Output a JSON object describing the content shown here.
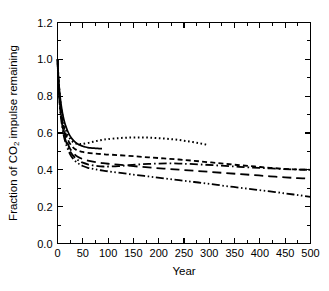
{
  "chart_data": {
    "type": "line",
    "title": "",
    "xlabel": "Year",
    "ylabel": "Fraction of CO2 impulse remaining",
    "ylabel_parts": {
      "pre": "Fraction of CO",
      "sub": "2",
      "post": " impulse remaining"
    },
    "xlim": [
      0,
      500
    ],
    "ylim": [
      0.0,
      1.2
    ],
    "xticks": [
      0,
      50,
      100,
      150,
      200,
      250,
      300,
      350,
      400,
      450,
      500
    ],
    "xtick_labels": [
      "0",
      "50",
      "100",
      "150",
      "200",
      "250",
      "300",
      "350",
      "400",
      "450",
      "500"
    ],
    "xminor_step": 25,
    "yticks": [
      0.0,
      0.2,
      0.4,
      0.6,
      0.8,
      1.0,
      1.2
    ],
    "ytick_labels": [
      "0.0",
      "0.2",
      "0.4",
      "0.6",
      "0.8",
      "1.0",
      "1.2"
    ],
    "yminor_step": 0.1,
    "grid": false,
    "legend": "none",
    "tick_direction": "in",
    "line_color": "#000000",
    "background": "#ffffff",
    "series": [
      {
        "name": "model-solid",
        "style": "solid",
        "dasharray": "",
        "width": 1.7,
        "x": [
          0,
          1,
          2,
          3,
          5,
          7,
          10,
          13,
          16,
          20,
          25,
          30,
          35,
          40,
          45,
          50,
          55,
          60,
          65,
          70,
          75,
          80,
          85,
          88
        ],
        "y": [
          1.0,
          0.945,
          0.9,
          0.862,
          0.802,
          0.757,
          0.706,
          0.668,
          0.64,
          0.611,
          0.583,
          0.564,
          0.55,
          0.54,
          0.533,
          0.528,
          0.524,
          0.521,
          0.519,
          0.518,
          0.517,
          0.516,
          0.515,
          0.515
        ]
      },
      {
        "name": "model-dotted",
        "style": "dotted",
        "dasharray": "1.6 2.6",
        "width": 2.0,
        "x": [
          0,
          1,
          2,
          3,
          5,
          7,
          10,
          13,
          16,
          20,
          25,
          30,
          35,
          40,
          45,
          50,
          60,
          70,
          80,
          90,
          100,
          120,
          140,
          160,
          180,
          200,
          220,
          240,
          260,
          280,
          297
        ],
        "y": [
          1.0,
          0.94,
          0.893,
          0.853,
          0.79,
          0.742,
          0.688,
          0.649,
          0.62,
          0.592,
          0.568,
          0.553,
          0.545,
          0.541,
          0.54,
          0.541,
          0.546,
          0.552,
          0.558,
          0.563,
          0.567,
          0.572,
          0.575,
          0.576,
          0.575,
          0.572,
          0.568,
          0.562,
          0.554,
          0.545,
          0.535
        ]
      },
      {
        "name": "model-short-dash",
        "style": "short-dash",
        "dasharray": "5 3.2",
        "width": 1.8,
        "x": [
          0,
          1,
          2,
          3,
          5,
          7,
          10,
          13,
          16,
          20,
          25,
          30,
          35,
          40,
          45,
          50,
          60,
          70,
          80,
          90,
          100,
          120,
          150,
          180,
          210,
          240,
          270,
          300,
          330,
          360,
          390,
          420,
          450,
          475,
          500
        ],
        "y": [
          1.0,
          0.932,
          0.881,
          0.839,
          0.773,
          0.722,
          0.666,
          0.626,
          0.597,
          0.567,
          0.54,
          0.523,
          0.512,
          0.505,
          0.5,
          0.497,
          0.492,
          0.489,
          0.487,
          0.485,
          0.483,
          0.48,
          0.474,
          0.468,
          0.462,
          0.456,
          0.449,
          0.441,
          0.433,
          0.425,
          0.418,
          0.411,
          0.405,
          0.402,
          0.4
        ]
      },
      {
        "name": "model-long-dash",
        "style": "long-dash",
        "dasharray": "9 5",
        "width": 1.8,
        "x": [
          0,
          1,
          2,
          3,
          5,
          7,
          10,
          13,
          16,
          20,
          25,
          30,
          35,
          40,
          45,
          50,
          60,
          70,
          80,
          90,
          100,
          120,
          150,
          180,
          210,
          240,
          270,
          300,
          330,
          360,
          390,
          420,
          450,
          475,
          500
        ],
        "y": [
          1.0,
          0.925,
          0.87,
          0.826,
          0.757,
          0.704,
          0.647,
          0.606,
          0.575,
          0.544,
          0.514,
          0.495,
          0.481,
          0.471,
          0.464,
          0.458,
          0.45,
          0.444,
          0.44,
          0.436,
          0.433,
          0.428,
          0.42,
          0.413,
          0.407,
          0.401,
          0.395,
          0.389,
          0.383,
          0.377,
          0.371,
          0.365,
          0.359,
          0.355,
          0.352
        ]
      },
      {
        "name": "model-dash-dot",
        "style": "dash-dot",
        "dasharray": "8 3 1.6 3",
        "width": 1.8,
        "x": [
          0,
          1,
          2,
          3,
          5,
          7,
          10,
          13,
          16,
          20,
          25,
          30,
          35,
          40,
          45,
          50,
          60,
          70,
          80,
          90,
          100,
          120,
          140,
          160,
          180,
          200,
          220,
          240,
          260,
          290,
          320,
          350,
          380,
          410,
          440,
          470,
          500
        ],
        "y": [
          1.0,
          0.918,
          0.861,
          0.815,
          0.745,
          0.691,
          0.633,
          0.592,
          0.561,
          0.53,
          0.5,
          0.48,
          0.465,
          0.454,
          0.446,
          0.439,
          0.43,
          0.424,
          0.42,
          0.418,
          0.418,
          0.42,
          0.425,
          0.429,
          0.432,
          0.434,
          0.435,
          0.434,
          0.432,
          0.428,
          0.423,
          0.418,
          0.413,
          0.409,
          0.405,
          0.402,
          0.4
        ]
      },
      {
        "name": "model-dash-dot-dot",
        "style": "dash-dot-dot",
        "dasharray": "8 2.6 1.5 2.6 1.5 2.6",
        "width": 1.8,
        "x": [
          0,
          1,
          2,
          3,
          5,
          7,
          10,
          13,
          16,
          20,
          25,
          30,
          35,
          40,
          45,
          50,
          60,
          70,
          80,
          90,
          100,
          120,
          150,
          180,
          210,
          240,
          270,
          300,
          330,
          360,
          390,
          420,
          450,
          475,
          500
        ],
        "y": [
          1.0,
          0.912,
          0.853,
          0.806,
          0.734,
          0.679,
          0.62,
          0.578,
          0.547,
          0.515,
          0.484,
          0.463,
          0.448,
          0.437,
          0.428,
          0.421,
          0.411,
          0.405,
          0.4,
          0.396,
          0.392,
          0.385,
          0.374,
          0.364,
          0.354,
          0.344,
          0.334,
          0.324,
          0.313,
          0.303,
          0.293,
          0.283,
          0.272,
          0.263,
          0.253
        ]
      }
    ]
  }
}
